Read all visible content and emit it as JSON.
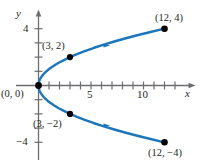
{
  "figure": {
    "background_color": "#ffffff",
    "curve_color": "#1b76bc",
    "axis_color": "#6d6e71",
    "text_color": "#231f20",
    "point_color": "#000000"
  },
  "axes": {
    "x_axis_label": "x",
    "y_axis_label": "y",
    "x_ticks_labeled": [
      {
        "value": 5,
        "label": "5"
      },
      {
        "value": 10,
        "label": "10"
      }
    ],
    "y_ticks_labeled": [
      {
        "value": 4,
        "label": "4"
      },
      {
        "value": -4,
        "label": "−4"
      }
    ],
    "x_tick_values": [
      1,
      2,
      3,
      4,
      5,
      6,
      7,
      8,
      9,
      10,
      11,
      12,
      13,
      14,
      15
    ],
    "y_tick_values": [
      1,
      2,
      3,
      4,
      -1,
      -2,
      -3,
      -4
    ],
    "x_range": [
      -1.4,
      15.3
    ],
    "y_range": [
      -5.4,
      5.3
    ],
    "grid": false
  },
  "chart_data": {
    "type": "line",
    "title": "",
    "xlabel": "x",
    "ylabel": "y",
    "xlim": [
      -1.4,
      15.3
    ],
    "ylim": [
      -5.4,
      5.3
    ],
    "grid": false,
    "legend": "none",
    "equation": "x = 3y²/4",
    "series": [
      {
        "name": "parabola x = 3y^2/4",
        "color": "#1b76bc",
        "x": [
          12.0,
          10.67,
          9.41,
          8.23,
          7.14,
          6.14,
          5.23,
          4.4,
          3.67,
          3.0,
          2.42,
          1.92,
          1.5,
          1.15,
          0.86,
          0.64,
          0.47,
          0.33,
          0.22,
          0.13,
          0.07,
          0.03,
          0.01,
          0.0,
          0.01,
          0.03,
          0.07,
          0.13,
          0.22,
          0.33,
          0.47,
          0.64,
          0.86,
          1.15,
          1.5,
          1.92,
          2.42,
          3.0,
          3.67,
          4.4,
          5.23,
          6.14,
          7.14,
          8.23,
          9.41,
          10.67,
          12.0
        ],
        "y": [
          4.0,
          3.77,
          3.54,
          3.31,
          3.08,
          2.86,
          2.64,
          2.42,
          2.21,
          2.0,
          1.79,
          1.6,
          1.41,
          1.24,
          1.07,
          0.92,
          0.79,
          0.66,
          0.54,
          0.42,
          0.31,
          0.2,
          0.1,
          0.0,
          -0.1,
          -0.2,
          -0.31,
          -0.42,
          -0.54,
          -0.66,
          -0.79,
          -0.92,
          -1.07,
          -1.24,
          -1.41,
          -1.6,
          -1.79,
          -2.0,
          -2.21,
          -2.42,
          -2.64,
          -2.86,
          -3.08,
          -3.31,
          -3.54,
          -3.77,
          -4.0
        ]
      }
    ],
    "marked_points": [
      {
        "x": 0,
        "y": 0,
        "label": "(0, 0)"
      },
      {
        "x": 3,
        "y": 2,
        "label": "(3, 2)"
      },
      {
        "x": 12,
        "y": 4,
        "label": "(12, 4)"
      },
      {
        "x": 3,
        "y": -2,
        "label": "(3, −2)"
      },
      {
        "x": 12,
        "y": -4,
        "label": "(12, −4)"
      }
    ],
    "direction_arrows": [
      {
        "x": 6.1,
        "y": 2.85,
        "note": "upper branch direction marker"
      },
      {
        "x": 6.1,
        "y": -2.85,
        "note": "lower branch direction marker"
      }
    ]
  },
  "point_labels": {
    "origin": "(0, 0)",
    "upper_inner": "(3, 2)",
    "upper_outer": "(12, 4)",
    "lower_inner": "(3, −2)",
    "lower_outer": "(12, −4)"
  }
}
